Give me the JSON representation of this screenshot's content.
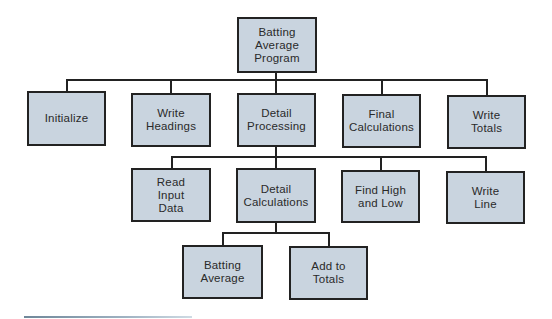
{
  "diagram": {
    "type": "hierarchy-chart",
    "colors": {
      "box_fill": "#c9d4df",
      "box_border": "#222222",
      "line": "#222222",
      "rule": "#7f97a8"
    },
    "nodes": [
      {
        "id": "root",
        "label": "Batting\nAverage\nProgram",
        "x": 237,
        "y": 17,
        "w": 80,
        "h": 56
      },
      {
        "id": "initialize",
        "label": "Initialize",
        "x": 27,
        "y": 91,
        "w": 79,
        "h": 55
      },
      {
        "id": "write-headings",
        "label": "Write\nHeadings",
        "x": 131,
        "y": 93,
        "w": 80,
        "h": 54
      },
      {
        "id": "detail-processing",
        "label": "Detail\nProcessing",
        "x": 237,
        "y": 93,
        "w": 79,
        "h": 54
      },
      {
        "id": "final-calculations",
        "label": "Final\nCalculations",
        "x": 342,
        "y": 94,
        "w": 79,
        "h": 54
      },
      {
        "id": "write-totals",
        "label": "Write\nTotals",
        "x": 447,
        "y": 95,
        "w": 79,
        "h": 54
      },
      {
        "id": "read-input-data",
        "label": "Read\nInput\nData",
        "x": 131,
        "y": 168,
        "w": 80,
        "h": 54
      },
      {
        "id": "detail-calculations",
        "label": "Detail\nCalculations",
        "x": 236,
        "y": 168,
        "w": 80,
        "h": 55
      },
      {
        "id": "find-high-and-low",
        "label": "Find High\nand Low",
        "x": 341,
        "y": 170,
        "w": 79,
        "h": 53
      },
      {
        "id": "write-line",
        "label": "Write\nLine",
        "x": 446,
        "y": 171,
        "w": 79,
        "h": 53
      },
      {
        "id": "batting-average",
        "label": "Batting\nAverage",
        "x": 182,
        "y": 245,
        "w": 81,
        "h": 54
      },
      {
        "id": "add-to-totals",
        "label": "Add to\nTotals",
        "x": 289,
        "y": 246,
        "w": 79,
        "h": 54
      }
    ],
    "edges": [
      {
        "from": "root",
        "to": "initialize"
      },
      {
        "from": "root",
        "to": "write-headings"
      },
      {
        "from": "root",
        "to": "detail-processing"
      },
      {
        "from": "root",
        "to": "final-calculations"
      },
      {
        "from": "root",
        "to": "write-totals"
      },
      {
        "from": "detail-processing",
        "to": "read-input-data"
      },
      {
        "from": "detail-processing",
        "to": "detail-calculations"
      },
      {
        "from": "detail-processing",
        "to": "find-high-and-low"
      },
      {
        "from": "detail-processing",
        "to": "write-line"
      },
      {
        "from": "detail-calculations",
        "to": "batting-average"
      },
      {
        "from": "detail-calculations",
        "to": "add-to-totals"
      }
    ],
    "connectors": [
      {
        "bus_y": 80,
        "parent_x": 276,
        "parent_bottom": 73,
        "children_x": [
          67,
          171,
          276,
          382,
          487
        ],
        "children_top": [
          91,
          93,
          93,
          94,
          95
        ]
      },
      {
        "bus_y": 157,
        "parent_x": 276,
        "parent_bottom": 147,
        "children_x": [
          172,
          276,
          381,
          486
        ],
        "children_top": [
          168,
          168,
          170,
          171
        ]
      },
      {
        "bus_y": 233,
        "parent_x": 276,
        "parent_bottom": 223,
        "children_x": [
          223,
          329
        ],
        "children_top": [
          245,
          246
        ]
      }
    ]
  }
}
